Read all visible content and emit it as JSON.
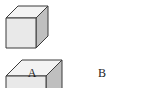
{
  "figure": {
    "background_color": "#ffffff",
    "shapes": [
      {
        "id": "cube-a",
        "label": "A",
        "relative_size": "small",
        "front_face_color": "#e9e9e9",
        "top_face_color": "#f3f3f3",
        "right_face_color": "#bfbfbf",
        "edge_color": "#3a3a3a",
        "hidden_edge_style": "dashed",
        "front_width_px": 30,
        "front_height_px": 30,
        "depth_offset_px": 12
      },
      {
        "id": "cube-b",
        "label": "B",
        "relative_size": "large",
        "front_face_color": "#e9e9e9",
        "top_face_color": "#f3f3f3",
        "right_face_color": "#bfbfbf",
        "edge_color": "#3a3a3a",
        "hidden_edge_style": "dashed",
        "front_width_px": 40,
        "front_height_px": 40,
        "depth_offset_px": 16
      }
    ],
    "labels": {
      "cube_a_label": "A",
      "cube_b_label": "B"
    }
  }
}
